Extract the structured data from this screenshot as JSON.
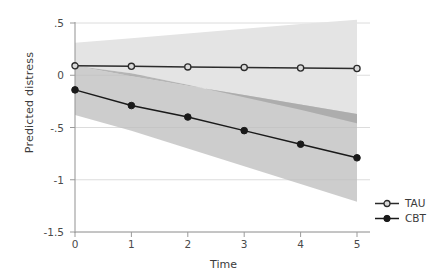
{
  "chart_data": {
    "type": "line",
    "title": "",
    "subtitle": "",
    "xlabel": "Time",
    "ylabel": "Predicted distress",
    "x": [
      0,
      1,
      2,
      3,
      4,
      5
    ],
    "xlim": [
      0,
      5
    ],
    "ylim": [
      -1.5,
      0.5
    ],
    "xticklabels": [
      "0",
      "1",
      "2",
      "3",
      "4",
      "5"
    ],
    "yticklabels": [
      ".5",
      "0",
      "-.5",
      "-1",
      "-1.5"
    ],
    "ytickvalues": [
      0.5,
      0,
      -0.5,
      -1,
      -1.5
    ],
    "grid": "horizontal",
    "legend_position": "right",
    "series": [
      {
        "name": "TAU",
        "marker": "open-circle",
        "color": "#2b2b2b",
        "values": [
          0.09,
          0.085,
          0.08,
          0.075,
          0.07,
          0.065
        ],
        "ci_band": {
          "label": "TAU 95% CI",
          "color": "#e4e4e4",
          "upper": [
            0.31,
            0.355,
            0.4,
            0.445,
            0.49,
            0.53
          ],
          "lower": [
            0.09,
            0.02,
            -0.09,
            -0.21,
            -0.33,
            -0.46
          ]
        }
      },
      {
        "name": "CBT",
        "marker": "filled-circle",
        "color": "#1a1a1a",
        "values": [
          -0.14,
          -0.29,
          -0.4,
          -0.53,
          -0.66,
          -0.79
        ],
        "ci_band": {
          "label": "CBT 95% CI",
          "color": "#bfbfbf",
          "upper": [
            0.09,
            -0.01,
            -0.1,
            -0.19,
            -0.28,
            -0.37
          ],
          "lower": [
            -0.38,
            -0.53,
            -0.7,
            -0.87,
            -1.04,
            -1.21
          ]
        }
      }
    ],
    "overlap_band_color": "#a8a8a8"
  },
  "legend": {
    "items": [
      {
        "label": "TAU",
        "marker": "open-circle"
      },
      {
        "label": "CBT",
        "marker": "filled-circle"
      }
    ]
  },
  "axes": {
    "y_title": "Predicted distress",
    "x_title": "Time"
  }
}
